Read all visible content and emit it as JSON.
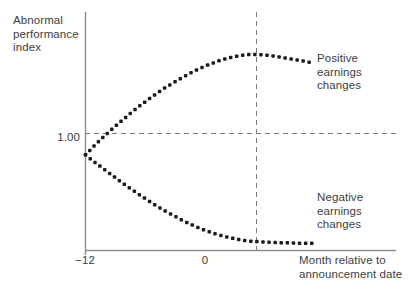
{
  "chart_data": {
    "type": "line",
    "title": "",
    "subtitle": "",
    "ylabel": "Abnormal\nperformance\nindex",
    "xlabel": "Month relative to\nannouncement date",
    "grid": false,
    "legend_position": "inline-right",
    "xlim": [
      -12,
      6
    ],
    "ylim": [
      0.8,
      1.3
    ],
    "xticks": [
      -12,
      0
    ],
    "xticklabels": [
      "−12",
      "0"
    ],
    "yticks": [
      1.0
    ],
    "yticklabels": [
      "1.00"
    ],
    "annotations": [
      {
        "name": "announcement-date-marker",
        "type": "vline",
        "x": 3,
        "style": "dashed",
        "label": ""
      },
      {
        "name": "baseline-index-marker",
        "type": "hline",
        "y": 1.0,
        "style": "dashed",
        "label": "1.00"
      }
    ],
    "series": [
      {
        "name": "Positive earnings changes",
        "label": "Positive\nearnings\nchanges",
        "marker": "dotted",
        "color": "#1c1c1c",
        "x": [
          -12,
          -11.3,
          -10.6,
          -9.9,
          -9.2,
          -8.5,
          -7.8,
          -7.1,
          -6.4,
          -5.7,
          -5.0,
          -4.3,
          -3.6,
          -2.9,
          -2.2,
          -1.5,
          -0.8,
          -0.1,
          0.6,
          1.3,
          2.0,
          2.7,
          3.4,
          4.1,
          4.8,
          5.4,
          6.0
        ],
        "y": [
          1.0,
          1.019,
          1.037,
          1.054,
          1.07,
          1.086,
          1.101,
          1.115,
          1.128,
          1.141,
          1.152,
          1.163,
          1.173,
          1.182,
          1.19,
          1.197,
          1.203,
          1.207,
          1.21,
          1.211,
          1.21,
          1.208,
          1.205,
          1.202,
          1.199,
          1.196,
          1.193
        ]
      },
      {
        "name": "Negative earnings changes",
        "label": "Negative\nearnings\nchanges",
        "marker": "dotted",
        "color": "#1c1c1c",
        "x": [
          -12,
          -11.3,
          -10.6,
          -9.9,
          -9.2,
          -8.5,
          -7.8,
          -7.1,
          -6.4,
          -5.7,
          -5.0,
          -4.3,
          -3.6,
          -2.9,
          -2.2,
          -1.5,
          -0.8,
          -0.1,
          0.6,
          1.3,
          2.0,
          2.7,
          3.4,
          4.1,
          4.8,
          5.4,
          6.0
        ],
        "y": [
          1.0,
          0.985,
          0.971,
          0.957,
          0.943,
          0.93,
          0.917,
          0.905,
          0.893,
          0.882,
          0.872,
          0.862,
          0.853,
          0.845,
          0.838,
          0.832,
          0.827,
          0.823,
          0.82,
          0.818,
          0.817,
          0.816,
          0.815,
          0.815,
          0.814,
          0.814,
          0.814
        ]
      }
    ]
  },
  "axes": {
    "y_axis_title": "Abnormal\nperformance\nindex",
    "x_axis_title": "Month relative to\nannouncement date",
    "y_tick_label": "1.00",
    "x_tick_label_left": "−12",
    "x_tick_label_mid": "0"
  },
  "labels": {
    "positive_series": "Positive\nearnings\nchanges",
    "negative_series": "Negative\nearnings\nchanges"
  },
  "colors": {
    "axis": "#8a8a8a",
    "dashed": "#7a7a7a",
    "dots": "#1c1c1c",
    "text": "#3d3d3d",
    "background": "#ffffff"
  }
}
